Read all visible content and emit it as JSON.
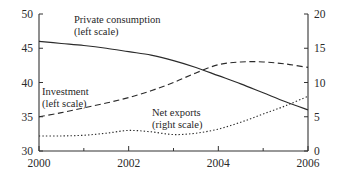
{
  "chart_data": {
    "type": "line",
    "title": "",
    "subtitle": "",
    "xlabel": "",
    "ylabel": "",
    "y2label": "",
    "grid": false,
    "legend_position": "inline-annotations",
    "xlim": [
      2000,
      2006
    ],
    "ylim": [
      30,
      50
    ],
    "y2lim": [
      0,
      20
    ],
    "xticks": [
      2000,
      2001,
      2002,
      2003,
      2004,
      2005,
      2006
    ],
    "xticklabels": [
      "2000",
      "",
      "2002",
      "",
      "2004",
      "",
      "2006"
    ],
    "yticks": [
      30,
      35,
      40,
      45,
      50
    ],
    "yticklabels": [
      "30",
      "35",
      "40",
      "45",
      "50"
    ],
    "y2ticks": [
      0,
      5,
      10,
      15,
      20
    ],
    "y2ticklabels": [
      "0",
      "5",
      "10",
      "15",
      "20"
    ],
    "x": [
      2000,
      2000.5,
      2001,
      2001.5,
      2002,
      2002.5,
      2003,
      2003.5,
      2004,
      2004.5,
      2005,
      2005.5,
      2006
    ],
    "series": [
      {
        "name": "Private consumption",
        "scale": "left",
        "style": "solid",
        "annotation": "Private consumption",
        "annotation_sub": "(left scale)",
        "values": [
          46.0,
          45.7,
          45.4,
          45.0,
          44.5,
          44.0,
          43.2,
          42.2,
          41.0,
          39.8,
          38.5,
          37.2,
          36.0
        ]
      },
      {
        "name": "Investment",
        "scale": "left",
        "style": "dashed",
        "annotation": "Investment",
        "annotation_sub": "(left scale)",
        "values": [
          35.0,
          35.6,
          36.3,
          37.0,
          37.8,
          38.8,
          40.0,
          41.4,
          42.6,
          43.0,
          43.0,
          42.7,
          42.2
        ]
      },
      {
        "name": "Net exports",
        "scale": "right",
        "style": "dotted",
        "annotation": "Net exports",
        "annotation_sub": "(right scale)",
        "values": [
          2.2,
          2.2,
          2.3,
          2.6,
          3.0,
          2.8,
          2.4,
          2.6,
          3.2,
          4.2,
          5.4,
          6.6,
          8.0
        ]
      }
    ]
  },
  "axes": {
    "left_ticks": [
      "50",
      "45",
      "40",
      "35",
      "30"
    ],
    "right_ticks": [
      "20",
      "15",
      "10",
      "5",
      "0"
    ],
    "x_ticks": [
      "2000",
      "2002",
      "2004",
      "2006"
    ]
  },
  "annotations": {
    "private_consumption_line1": "Private consumption",
    "private_consumption_line2": "(left scale)",
    "investment_line1": "Investment",
    "investment_line2": "(left scale)",
    "net_exports_line1": "Net exports",
    "net_exports_line2": "(right scale)"
  },
  "colors": {
    "axis": "#333333",
    "line": "#2b2b2b",
    "text": "#1f1f1f",
    "background": "#ffffff"
  }
}
